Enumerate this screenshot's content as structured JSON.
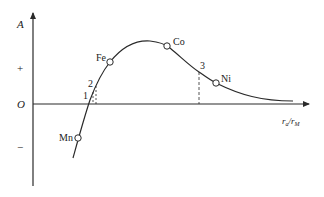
{
  "diagram": {
    "axes": {
      "y_label": "A",
      "plus_label": "+",
      "origin_label": "O",
      "minus_label": "−",
      "x_label_main": "r",
      "x_label_sub1": "a",
      "x_label_slash": "/",
      "x_label_main2": "r",
      "x_label_sub2": "M"
    },
    "elements": [
      {
        "name": "Mn",
        "label": "Mn"
      },
      {
        "name": "Fe",
        "label": "Fe"
      },
      {
        "name": "Co",
        "label": "Co"
      },
      {
        "name": "Ni",
        "label": "Ni"
      }
    ],
    "markers": [
      {
        "label": "1"
      },
      {
        "label": "2"
      },
      {
        "label": "3"
      }
    ],
    "colors": {
      "line": "#2a2a2a",
      "background": "#ffffff"
    }
  }
}
